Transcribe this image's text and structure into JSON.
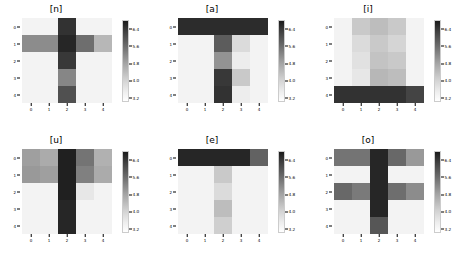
{
  "figure": {
    "width": 468,
    "height": 262,
    "background": "#ffffff",
    "layout": "2 rows x 3 columns of heatmap panels",
    "colormap": "Greys (dark = high value)",
    "vmin_color": "#ffffff",
    "vmax_color": "#1a1a1a"
  },
  "chart_data": [
    {
      "type": "heatmap",
      "title": "[n]",
      "xlabel": "",
      "ylabel": "",
      "xticklabels": [
        "0",
        "1",
        "2",
        "3",
        "4"
      ],
      "yticklabels": [
        "0",
        "1",
        "2",
        "3",
        "4"
      ],
      "grid": false,
      "colorbar": {
        "ticks": [
          6.4,
          5.6,
          4.8,
          4.0,
          3.2
        ],
        "ticklabels": [
          "6.4",
          "5.6",
          "4.8",
          "4.0",
          "3.2"
        ],
        "orientation": "vertical",
        "position": "right",
        "vmin": 3.0,
        "vmax": 6.8
      },
      "values": [
        [
          3.2,
          3.2,
          6.4,
          3.2,
          3.2
        ],
        [
          4.9,
          4.9,
          6.6,
          5.4,
          4.2
        ],
        [
          3.2,
          3.2,
          6.3,
          3.2,
          3.2
        ],
        [
          3.2,
          3.2,
          5.0,
          3.2,
          3.2
        ],
        [
          3.2,
          3.2,
          5.9,
          3.2,
          3.2
        ]
      ]
    },
    {
      "type": "heatmap",
      "title": "[a]",
      "xlabel": "",
      "ylabel": "",
      "xticklabels": [
        "0",
        "1",
        "2",
        "3",
        "4"
      ],
      "yticklabels": [
        "0",
        "1",
        "2",
        "3",
        "4"
      ],
      "grid": false,
      "colorbar": {
        "ticks": [
          6.4,
          5.6,
          4.8,
          4.0,
          3.2
        ],
        "ticklabels": [
          "6.4",
          "5.6",
          "4.8",
          "4.0",
          "3.2"
        ],
        "orientation": "vertical",
        "position": "right",
        "vmin": 3.0,
        "vmax": 6.8
      },
      "values": [
        [
          6.5,
          6.5,
          6.5,
          6.5,
          6.5
        ],
        [
          3.2,
          3.2,
          5.7,
          3.6,
          3.2
        ],
        [
          3.2,
          3.2,
          4.8,
          3.3,
          3.2
        ],
        [
          3.2,
          3.2,
          6.3,
          3.9,
          3.2
        ],
        [
          3.2,
          3.2,
          6.4,
          3.3,
          3.2
        ]
      ]
    },
    {
      "type": "heatmap",
      "title": "[i]",
      "xlabel": "",
      "ylabel": "",
      "xticklabels": [
        "0",
        "1",
        "2",
        "3",
        "4"
      ],
      "yticklabels": [
        "0",
        "1",
        "2",
        "3",
        "4"
      ],
      "grid": false,
      "colorbar": {
        "ticks": [
          6.4,
          5.6,
          4.8,
          4.0,
          3.2
        ],
        "ticklabels": [
          "6.4",
          "5.6",
          "4.8",
          "4.0",
          "3.2"
        ],
        "orientation": "vertical",
        "position": "right",
        "vmin": 3.0,
        "vmax": 6.8
      },
      "values": [
        [
          3.2,
          3.9,
          4.1,
          3.9,
          3.2
        ],
        [
          3.2,
          3.6,
          3.9,
          3.7,
          3.2
        ],
        [
          3.2,
          3.5,
          4.0,
          3.9,
          3.2
        ],
        [
          3.2,
          3.4,
          4.2,
          4.1,
          3.2
        ],
        [
          6.4,
          6.4,
          6.4,
          6.4,
          6.1
        ]
      ]
    },
    {
      "type": "heatmap",
      "title": "[u]",
      "xlabel": "",
      "ylabel": "",
      "xticklabels": [
        "0",
        "1",
        "2",
        "3",
        "4"
      ],
      "yticklabels": [
        "0",
        "1",
        "2",
        "3",
        "4"
      ],
      "grid": false,
      "colorbar": {
        "ticks": [
          6.4,
          5.6,
          4.8,
          4.0,
          3.2
        ],
        "ticklabels": [
          "6.4",
          "5.6",
          "4.8",
          "4.0",
          "3.2"
        ],
        "orientation": "vertical",
        "position": "right",
        "vmin": 3.0,
        "vmax": 6.8
      },
      "values": [
        [
          4.6,
          4.4,
          6.7,
          5.3,
          4.3
        ],
        [
          4.7,
          4.6,
          6.7,
          5.1,
          4.4
        ],
        [
          3.2,
          3.2,
          6.7,
          3.4,
          3.2
        ],
        [
          3.2,
          3.2,
          6.6,
          3.2,
          3.2
        ],
        [
          3.2,
          3.2,
          6.6,
          3.2,
          3.2
        ]
      ]
    },
    {
      "type": "heatmap",
      "title": "[e]",
      "xlabel": "",
      "ylabel": "",
      "xticklabels": [
        "0",
        "1",
        "2",
        "3",
        "4"
      ],
      "yticklabels": [
        "0",
        "1",
        "2",
        "3",
        "4"
      ],
      "grid": false,
      "colorbar": {
        "ticks": [
          6.4,
          5.6,
          4.8,
          4.0,
          3.2
        ],
        "ticklabels": [
          "6.4",
          "5.6",
          "4.8",
          "4.0",
          "3.2"
        ],
        "orientation": "vertical",
        "position": "right",
        "vmin": 3.0,
        "vmax": 6.8
      },
      "values": [
        [
          6.6,
          6.6,
          6.6,
          6.6,
          5.6
        ],
        [
          3.2,
          3.2,
          3.9,
          3.2,
          3.2
        ],
        [
          3.2,
          3.2,
          3.6,
          3.2,
          3.2
        ],
        [
          3.2,
          3.2,
          4.1,
          3.2,
          3.2
        ],
        [
          3.2,
          3.2,
          3.8,
          3.2,
          3.2
        ]
      ]
    },
    {
      "type": "heatmap",
      "title": "[o]",
      "xlabel": "",
      "ylabel": "",
      "xticklabels": [
        "0",
        "1",
        "2",
        "3",
        "4"
      ],
      "yticklabels": [
        "0",
        "1",
        "2",
        "3",
        "4"
      ],
      "grid": false,
      "colorbar": {
        "ticks": [
          6.4,
          5.6,
          4.8,
          4.0,
          3.2
        ],
        "ticklabels": [
          "6.4",
          "5.6",
          "4.8",
          "4.0",
          "3.2"
        ],
        "orientation": "vertical",
        "position": "right",
        "vmin": 3.0,
        "vmax": 6.8
      },
      "values": [
        [
          5.3,
          5.3,
          6.6,
          5.5,
          4.7
        ],
        [
          3.2,
          3.2,
          6.6,
          3.2,
          3.2
        ],
        [
          5.5,
          5.2,
          6.6,
          5.4,
          4.9
        ],
        [
          3.2,
          3.2,
          6.6,
          3.2,
          3.2
        ],
        [
          3.2,
          3.2,
          5.8,
          3.2,
          3.2
        ]
      ]
    }
  ]
}
